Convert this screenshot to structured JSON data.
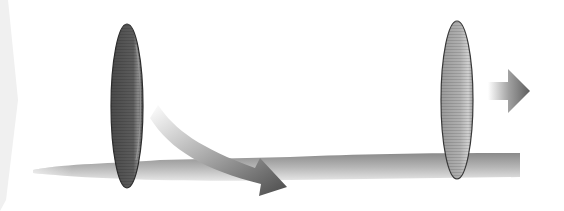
{
  "diagram": {
    "type": "two-lens-rod-illustration",
    "elements": [
      {
        "id": "left-chevron",
        "shape": "faint-chevron",
        "color": "#eeeeee"
      },
      {
        "id": "rod",
        "shape": "horizontal-bar",
        "color": "#9a9a9a"
      },
      {
        "id": "lens-left",
        "shape": "ellipse",
        "fill": "#555555",
        "stroke": "#333333"
      },
      {
        "id": "lens-right",
        "shape": "ellipse",
        "fill": "#a8a8a8",
        "stroke": "#444444"
      },
      {
        "id": "arrow-curved",
        "shape": "curved-arrow",
        "color": "#555555",
        "direction": "down-right"
      },
      {
        "id": "arrow-straight",
        "shape": "straight-arrow",
        "color": "#666666",
        "direction": "right"
      }
    ]
  }
}
